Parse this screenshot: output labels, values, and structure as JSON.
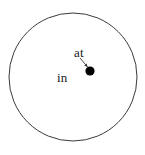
{
  "figure": {
    "background_color": "#ffffff",
    "stroke_color": "#3a3a3a",
    "point_color": "#000000",
    "text_color": "#1a1a1a",
    "width": 145,
    "height": 155
  },
  "diagram": {
    "type": "set-membership-diagram",
    "shapes": [
      {
        "name": "boundary-circle",
        "kind": "circle",
        "cx": 73,
        "cy": 77,
        "r": 64,
        "fill": "none",
        "stroke": "#3a3a3a",
        "stroke_width": 1
      },
      {
        "name": "point-marker",
        "kind": "dot",
        "cx": 90,
        "cy": 71,
        "r": 4.6,
        "fill": "#000000"
      },
      {
        "name": "pointer-arrow",
        "kind": "arrow",
        "x1": 80,
        "y1": 58,
        "x2": 87.5,
        "y2": 67,
        "stroke": "#3a3a3a",
        "stroke_width": 0.9
      }
    ],
    "labels": {
      "interior": "in",
      "point": "at"
    }
  }
}
